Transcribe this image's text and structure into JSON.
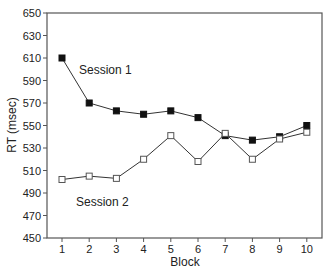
{
  "chart_data": {
    "type": "line",
    "title": "",
    "xlabel": "Block",
    "ylabel": "RT (msec)",
    "x": [
      1,
      2,
      3,
      4,
      5,
      6,
      7,
      8,
      9,
      10
    ],
    "xticks": [
      "1",
      "2",
      "3",
      "4",
      "5",
      "6",
      "7",
      "8",
      "9",
      "10"
    ],
    "yticks": [
      "450",
      "470",
      "490",
      "510",
      "530",
      "550",
      "570",
      "590",
      "610",
      "630",
      "650"
    ],
    "ylim": [
      450,
      650
    ],
    "grid": false,
    "legend": "inline annotations",
    "series": [
      {
        "name": "Session 1",
        "marker": "filled-square",
        "values": [
          610,
          570,
          563,
          560,
          563,
          557,
          541,
          537,
          540,
          550
        ]
      },
      {
        "name": "Session 2",
        "marker": "open-square",
        "values": [
          502,
          505,
          503,
          520,
          541,
          518,
          543,
          520,
          538,
          544
        ]
      }
    ],
    "annotations": [
      {
        "text": "Session 1",
        "near_block": 2.5,
        "near_value": 600
      },
      {
        "text": "Session 2",
        "near_block": 2.8,
        "near_value": 485
      }
    ]
  },
  "colors": {
    "axis": "#555555",
    "line": "#333333",
    "marker_fill_s1": "#111111",
    "marker_fill_s2": "#ffffff",
    "text": "#222222"
  }
}
